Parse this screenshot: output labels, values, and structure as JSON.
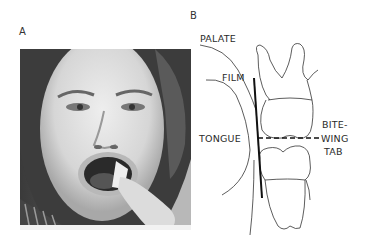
{
  "figure": {
    "panel_a": {
      "label": "A",
      "image": "patient-holding-bitewing-film-photo"
    },
    "panel_b": {
      "label": "B",
      "labels": {
        "palate": "PALATE",
        "film": "FILM",
        "tongue": "TONGUE",
        "bite_line1": "BITE-",
        "bite_line2": "WING",
        "bite_line3": "TAB"
      }
    }
  }
}
